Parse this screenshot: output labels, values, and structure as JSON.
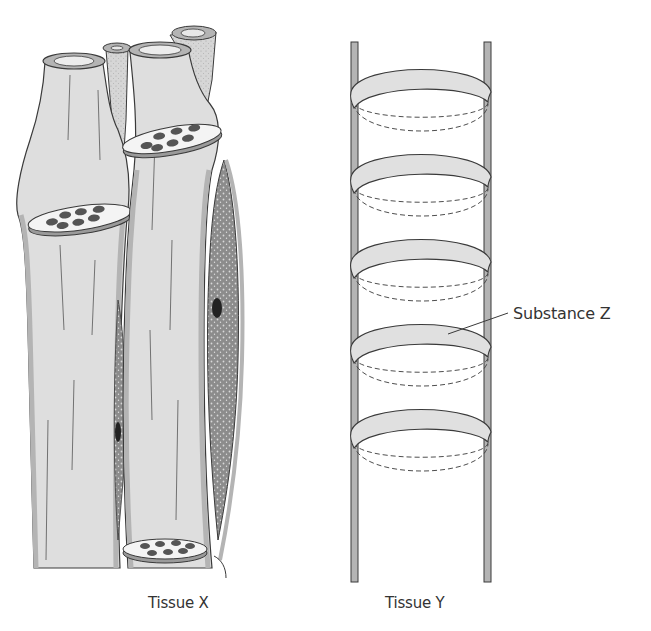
{
  "diagram": {
    "tissue_x": {
      "label": "Tissue X",
      "fibers": 3,
      "cross_sections_with_fibrils": 3,
      "nuclei_visible": 2
    },
    "tissue_y": {
      "label": "Tissue Y",
      "rings": 5,
      "annotation": {
        "label": "Substance Z",
        "points_to": "ring 4"
      }
    }
  },
  "colors": {
    "fill_light": "#e2e2e2",
    "fill_wall": "#b4b4b4",
    "fill_dark_stipple": "#8a8a8a",
    "stroke": "#3a3a3a",
    "nucleus": "#222222",
    "text": "#333333"
  }
}
